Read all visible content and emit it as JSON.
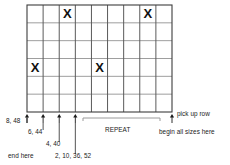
{
  "diagram": {
    "grid": {
      "columns": 9,
      "rows": 6,
      "x": 27,
      "y": 5,
      "width": 145,
      "height": 107,
      "vline_color": "#5a5a5a",
      "hline_color": "#8d8d8d",
      "border_color": "#3c3c3c",
      "fill_color": "#ffffff"
    },
    "marks": {
      "symbol": "X",
      "color": "#111111",
      "cells": [
        {
          "row": 1,
          "col": 3
        },
        {
          "row": 1,
          "col": 8
        },
        {
          "row": 4,
          "col": 1
        },
        {
          "row": 4,
          "col": 5
        }
      ]
    },
    "arrows": {
      "color": "#1a1a1a",
      "items": [
        {
          "name": "arrow-8-48",
          "col_boundary": 0
        },
        {
          "name": "arrow-6-44",
          "col_boundary": 1
        },
        {
          "name": "arrow-4-40",
          "col_boundary": 2
        },
        {
          "name": "arrow-2-10-36-52",
          "col_boundary": 3
        },
        {
          "name": "arrow-begin-all-sizes",
          "col_boundary": 9
        }
      ]
    },
    "bracket": {
      "label": "REPEAT",
      "x_start": 83,
      "x_end": 160,
      "y": 118,
      "color": "#9a9a9a"
    },
    "labels": {
      "size_8_48": "8, 48",
      "size_6_44": "6, 44",
      "size_4_40": "4, 40",
      "size_2_10_36_52": "2, 10, 36, 52",
      "end_here": "end here",
      "repeat": "REPEAT",
      "pick_up_row": "pick up row",
      "begin_all_sizes_here": "begin all sizes here"
    }
  }
}
